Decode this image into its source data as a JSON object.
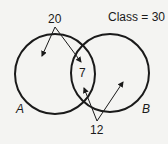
{
  "diagram": {
    "type": "venn",
    "total_label": "Class = 30",
    "sets": [
      {
        "name": "A",
        "label": "A"
      },
      {
        "name": "B",
        "label": "B"
      }
    ],
    "annotations": {
      "top_value": "20",
      "intersection_value": "7",
      "bottom_value": "12"
    },
    "colors": {
      "stroke": "#1a1a1a",
      "background": "#f4f4f2"
    }
  }
}
